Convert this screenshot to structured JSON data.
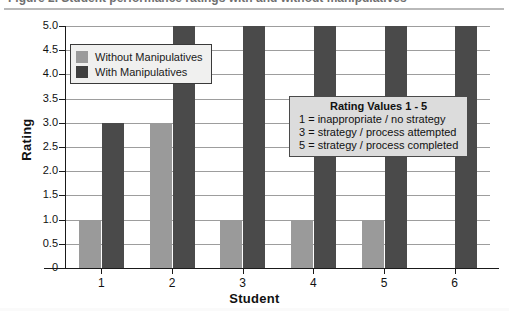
{
  "title_sliver": "Figure 2. Student performance ratings with and without manipulatives",
  "chart_data": {
    "type": "bar",
    "title": "",
    "xlabel": "Student",
    "ylabel": "Rating",
    "categories": [
      "1",
      "2",
      "3",
      "4",
      "5",
      "6"
    ],
    "series": [
      {
        "name": "Without Manipulatives",
        "color": "#9a9a9a",
        "values": [
          1,
          3,
          1,
          1,
          1,
          0
        ]
      },
      {
        "name": "With Manipulatives",
        "color": "#4a4a4a",
        "values": [
          3,
          5,
          5,
          5,
          5,
          5
        ]
      }
    ],
    "ylim": [
      0,
      5
    ],
    "yticks": [
      "0",
      "0.5",
      "1.0",
      "1.5",
      "2.0",
      "2.5",
      "3.0",
      "3.5",
      "4.0",
      "4.5",
      "5.0"
    ],
    "ytick_values": [
      0,
      0.5,
      1.0,
      1.5,
      2.0,
      2.5,
      3.0,
      3.5,
      4.0,
      4.5,
      5.0
    ],
    "grid": true,
    "legend_position": "top-left-inside"
  },
  "legend": {
    "items": [
      {
        "label": "Without Manipulatives",
        "swatch": "light"
      },
      {
        "label": "With Manipulatives",
        "swatch": "dark"
      }
    ]
  },
  "rating_box": {
    "title": "Rating Values 1 - 5",
    "lines": [
      "1 = inappropriate / no strategy",
      "3 = strategy / process attempted",
      "5 = strategy / process completed"
    ]
  },
  "colors": {
    "without_manipulatives": "#9a9a9a",
    "with_manipulatives": "#4a4a4a",
    "gridline": "#9d9d9d",
    "axis": "#1a1a1a",
    "legend_background": "#f0f0ef",
    "rating_box_background": "#dcdcdc"
  }
}
